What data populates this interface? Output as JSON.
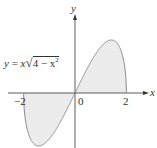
{
  "figure": {
    "equation": {
      "lhs": "y",
      "eq": " = ",
      "x": "x",
      "radicand": "4 − x",
      "exp": "2"
    },
    "axes": {
      "x_label": "x",
      "y_label": "y"
    },
    "ticks": {
      "neg2": "−2",
      "zero": "0",
      "pos2": "2"
    },
    "function": "y = x*sqrt(4 - x^2)",
    "domain": [
      -2,
      2
    ],
    "colors": {
      "curve": "#8a8a8a",
      "fill": "#ececec",
      "axis": "#333333"
    }
  }
}
